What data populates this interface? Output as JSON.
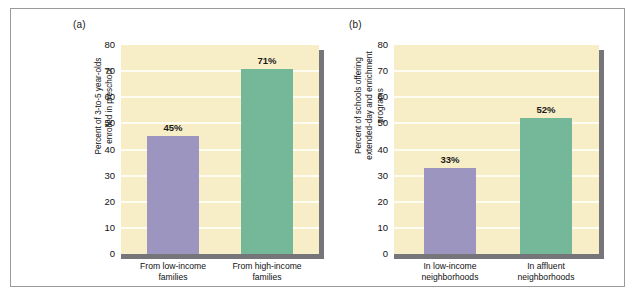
{
  "figure": {
    "background_color": "#ffffff",
    "frame_color": "#9a9a9a",
    "plot_background_color": "#f7edc6",
    "gridline_color": "#fffdf2",
    "shadow_color": "#76757a",
    "purple_color": "#9b95c0",
    "green_color": "#74b899"
  },
  "panels": [
    {
      "tag": "(a)",
      "ylabel": "Percent of 3-to-5 year-olds\nenrolled in preschool",
      "yticks": [
        "80",
        "70",
        "60",
        "50",
        "40",
        "30",
        "20",
        "10",
        "0"
      ],
      "bars": [
        {
          "label": "From low-income\nfamilies",
          "value_label": "45%",
          "value": 45,
          "color_name": "purple"
        },
        {
          "label": "From high-income\nfamilies",
          "value_label": "71%",
          "value": 71,
          "color_name": "green"
        }
      ]
    },
    {
      "tag": "(b)",
      "ylabel": "Percent of schools offering\nextended-day and enrichment\nprograms",
      "yticks": [
        "80",
        "70",
        "60",
        "50",
        "40",
        "30",
        "20",
        "10",
        "0"
      ],
      "bars": [
        {
          "label": "In low-income\nneighborhoods",
          "value_label": "33%",
          "value": 33,
          "color_name": "purple"
        },
        {
          "label": "In affluent\nneighborhoods",
          "value_label": "52%",
          "value": 52,
          "color_name": "green"
        }
      ]
    }
  ],
  "chart_data": [
    {
      "type": "bar",
      "panel": "(a)",
      "title": "",
      "xlabel": "",
      "ylabel": "Percent of 3-to-5 year-olds enrolled in preschool",
      "categories": [
        "From low-income families",
        "From high-income families"
      ],
      "values": [
        45,
        71
      ],
      "data_labels": [
        "45%",
        "71%"
      ],
      "bar_colors": [
        "#9b95c0",
        "#74b899"
      ],
      "ylim": [
        0,
        80
      ],
      "ytick_values": [
        0,
        10,
        20,
        30,
        40,
        50,
        60,
        70,
        80
      ],
      "ytick_labels": [
        "0",
        "10",
        "20",
        "30",
        "40",
        "50",
        "60",
        "70",
        "80"
      ],
      "grid": true,
      "legend": "none"
    },
    {
      "type": "bar",
      "panel": "(b)",
      "title": "",
      "xlabel": "",
      "ylabel": "Percent of schools offering extended-day and enrichment programs",
      "categories": [
        "In low-income neighborhoods",
        "In affluent neighborhoods"
      ],
      "values": [
        33,
        52
      ],
      "data_labels": [
        "33%",
        "52%"
      ],
      "bar_colors": [
        "#9b95c0",
        "#74b899"
      ],
      "ylim": [
        0,
        80
      ],
      "ytick_values": [
        0,
        10,
        20,
        30,
        40,
        50,
        60,
        70,
        80
      ],
      "ytick_labels": [
        "0",
        "10",
        "20",
        "30",
        "40",
        "50",
        "60",
        "70",
        "80"
      ],
      "grid": true,
      "legend": "none"
    }
  ]
}
